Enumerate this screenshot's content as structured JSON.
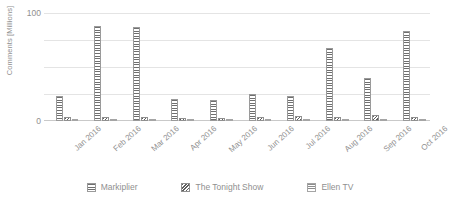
{
  "chart_data": {
    "type": "bar",
    "title": "",
    "subtitle": "",
    "xlabel": "",
    "ylabel": "Comments [Millions]",
    "categories": [
      "Jan 2016",
      "Feb 2016",
      "Mar 2016",
      "Apr 2016",
      "May 2016",
      "Jun 2016",
      "Jul 2016",
      "Aug 2016",
      "Sep 2016",
      "Oct 2016"
    ],
    "series": [
      {
        "name": "Markiplier",
        "values": [
          23,
          88,
          87,
          20,
          19,
          25,
          23,
          68,
          40,
          83
        ]
      },
      {
        "name": "The Tonight Show",
        "values": [
          4,
          4,
          4,
          3,
          3,
          4,
          5,
          4,
          6,
          4
        ]
      },
      {
        "name": "Ellen TV",
        "values": [
          2,
          2,
          2,
          1,
          1,
          2,
          2,
          2,
          2,
          2
        ]
      }
    ],
    "ylim": [
      0,
      100
    ],
    "yticks": [
      0,
      25,
      50,
      75,
      100
    ],
    "ytick_labels": [
      "0",
      "",
      "",
      "",
      "100"
    ],
    "grid": true,
    "legend_position": "bottom",
    "colors": {
      "series_0": "#6f6f6f",
      "series_1": "#5e5e5e",
      "series_2": "#8d8d8d",
      "gridline": "#e4e4e4",
      "axis": "#c9c9c9",
      "text": "#8f8f8f",
      "background": "#ffffff"
    }
  }
}
